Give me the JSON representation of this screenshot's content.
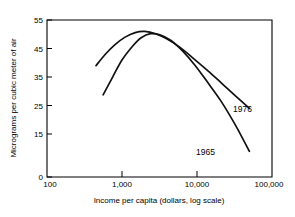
{
  "chart_data": {
    "type": "line",
    "title": "",
    "xlabel": "Income per capita (dollars, log scale)",
    "ylabel": "Micrograms per cubic meter of air",
    "xscale": "log",
    "xlim": [
      100,
      100000
    ],
    "ylim": [
      0,
      55
    ],
    "grid": false,
    "legend_position": "inline-annotation",
    "xticks": [
      100,
      1000,
      10000,
      100000
    ],
    "xtick_labels": [
      "100",
      "1,000",
      "10,000",
      "100,000"
    ],
    "yticks": [
      0,
      15,
      25,
      35,
      45,
      55
    ],
    "ytick_labels": [
      "0",
      "15",
      "25",
      "35",
      "45",
      "55"
    ],
    "series": [
      {
        "name": "1976",
        "label": "1976",
        "x": [
          450,
          600,
          800,
          1100,
          1500,
          2000,
          2800,
          4000,
          6000,
          9000,
          14000,
          21000,
          32000,
          50000
        ],
        "values": [
          39.0,
          43.0,
          46.3,
          49.0,
          50.6,
          51.0,
          50.2,
          48.3,
          45.3,
          41.5,
          37.2,
          33.0,
          28.6,
          24.0
        ]
      },
      {
        "name": "1965",
        "label": "1965",
        "x": [
          560,
          750,
          1000,
          1400,
          1800,
          2400,
          3200,
          4500,
          6500,
          9500,
          14000,
          21000,
          32000,
          50000
        ],
        "values": [
          28.8,
          35.0,
          41.0,
          46.0,
          48.8,
          50.2,
          49.8,
          47.8,
          44.0,
          39.0,
          33.0,
          26.5,
          18.5,
          9.0
        ]
      }
    ],
    "annotations": [
      {
        "text": "1976",
        "x": 23000,
        "y": 30.5
      },
      {
        "text": "1965",
        "x": 13000,
        "y": 15.5
      }
    ]
  }
}
